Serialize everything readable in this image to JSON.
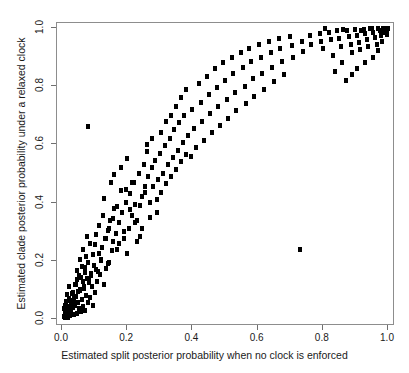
{
  "chart_data": {
    "type": "scatter",
    "title": "",
    "xlabel": "Estimated split posterior probability when no clock is enforced",
    "ylabel": "Estimated clade posterior probability under a relaxed clock",
    "xlim": [
      0.0,
      1.0
    ],
    "ylim": [
      0.0,
      1.0
    ],
    "xticks": [
      "0.0",
      "0.2",
      "0.4",
      "0.6",
      "0.8",
      "1.0"
    ],
    "xtick_values": [
      0.0,
      0.2,
      0.4,
      0.6,
      0.8,
      1.0
    ],
    "yticks": [
      "0.0",
      "0.2",
      "0.4",
      "0.6",
      "0.8",
      "1.0"
    ],
    "ytick_values": [
      0.0,
      0.2,
      0.4,
      0.6,
      0.8,
      1.0
    ],
    "grid": false,
    "legend": false,
    "marker": "filled-square",
    "marker_color": "#000000",
    "marker_size_px": 4,
    "border_color": "#8d8d8d",
    "background_color": "#ffffff",
    "n_points": 232,
    "series": [
      {
        "name": "clades",
        "points": [
          [
            0.005,
            0.01
          ],
          [
            0.008,
            0.004
          ],
          [
            0.01,
            0.022
          ],
          [
            0.012,
            0.008
          ],
          [
            0.006,
            0.035
          ],
          [
            0.015,
            0.015
          ],
          [
            0.018,
            0.006
          ],
          [
            0.009,
            0.048
          ],
          [
            0.021,
            0.03
          ],
          [
            0.013,
            0.06
          ],
          [
            0.024,
            0.012
          ],
          [
            0.017,
            0.042
          ],
          [
            0.028,
            0.024
          ],
          [
            0.011,
            0.018
          ],
          [
            0.031,
            0.055
          ],
          [
            0.02,
            0.07
          ],
          [
            0.034,
            0.038
          ],
          [
            0.014,
            0.085
          ],
          [
            0.037,
            0.016
          ],
          [
            0.026,
            0.062
          ],
          [
            0.04,
            0.045
          ],
          [
            0.019,
            0.028
          ],
          [
            0.043,
            0.078
          ],
          [
            0.029,
            0.034
          ],
          [
            0.046,
            0.02
          ],
          [
            0.033,
            0.092
          ],
          [
            0.049,
            0.058
          ],
          [
            0.023,
            0.11
          ],
          [
            0.052,
            0.036
          ],
          [
            0.038,
            0.072
          ],
          [
            0.055,
            0.1
          ],
          [
            0.027,
            0.05
          ],
          [
            0.058,
            0.026
          ],
          [
            0.042,
            0.12
          ],
          [
            0.061,
            0.066
          ],
          [
            0.032,
            0.088
          ],
          [
            0.064,
            0.044
          ],
          [
            0.047,
            0.135
          ],
          [
            0.067,
            0.105
          ],
          [
            0.036,
            0.064
          ],
          [
            0.07,
            0.03
          ],
          [
            0.051,
            0.15
          ],
          [
            0.073,
            0.082
          ],
          [
            0.041,
            0.118
          ],
          [
            0.076,
            0.14
          ],
          [
            0.056,
            0.098
          ],
          [
            0.079,
            0.056
          ],
          [
            0.045,
            0.165
          ],
          [
            0.082,
            0.125
          ],
          [
            0.06,
            0.18
          ],
          [
            0.085,
            0.074
          ],
          [
            0.05,
            0.095
          ],
          [
            0.088,
            0.155
          ],
          [
            0.065,
            0.13
          ],
          [
            0.091,
            0.11
          ],
          [
            0.054,
            0.205
          ],
          [
            0.094,
            0.048
          ],
          [
            0.07,
            0.16
          ],
          [
            0.097,
            0.185
          ],
          [
            0.059,
            0.142
          ],
          [
            0.1,
            0.09
          ],
          [
            0.075,
            0.215
          ],
          [
            0.104,
            0.17
          ],
          [
            0.063,
            0.24
          ],
          [
            0.108,
            0.128
          ],
          [
            0.08,
            0.195
          ],
          [
            0.112,
            0.225
          ],
          [
            0.068,
            0.112
          ],
          [
            0.116,
            0.152
          ],
          [
            0.085,
            0.26
          ],
          [
            0.12,
            0.2
          ],
          [
            0.072,
            0.178
          ],
          [
            0.124,
            0.245
          ],
          [
            0.09,
            0.148
          ],
          [
            0.128,
            0.118
          ],
          [
            0.077,
            0.285
          ],
          [
            0.132,
            0.275
          ],
          [
            0.095,
            0.222
          ],
          [
            0.136,
            0.172
          ],
          [
            0.082,
            0.132
          ],
          [
            0.08,
            0.66
          ],
          [
            0.14,
            0.305
          ],
          [
            0.1,
            0.255
          ],
          [
            0.144,
            0.195
          ],
          [
            0.148,
            0.34
          ],
          [
            0.105,
            0.29
          ],
          [
            0.152,
            0.235
          ],
          [
            0.11,
            0.162
          ],
          [
            0.156,
            0.265
          ],
          [
            0.115,
            0.32
          ],
          [
            0.16,
            0.38
          ],
          [
            0.12,
            0.205
          ],
          [
            0.165,
            0.295
          ],
          [
            0.125,
            0.355
          ],
          [
            0.17,
            0.24
          ],
          [
            0.13,
            0.415
          ],
          [
            0.175,
            0.33
          ],
          [
            0.135,
            0.275
          ],
          [
            0.18,
            0.44
          ],
          [
            0.14,
            0.19
          ],
          [
            0.185,
            0.365
          ],
          [
            0.145,
            0.31
          ],
          [
            0.19,
            0.275
          ],
          [
            0.15,
            0.47
          ],
          [
            0.195,
            0.4
          ],
          [
            0.155,
            0.345
          ],
          [
            0.2,
            0.225
          ],
          [
            0.16,
            0.495
          ],
          [
            0.205,
            0.31
          ],
          [
            0.17,
            0.385
          ],
          [
            0.21,
            0.43
          ],
          [
            0.175,
            0.26
          ],
          [
            0.215,
            0.355
          ],
          [
            0.18,
            0.52
          ],
          [
            0.22,
            0.47
          ],
          [
            0.19,
            0.3
          ],
          [
            0.225,
            0.395
          ],
          [
            0.195,
            0.445
          ],
          [
            0.23,
            0.34
          ],
          [
            0.2,
            0.55
          ],
          [
            0.235,
            0.5
          ],
          [
            0.21,
            0.375
          ],
          [
            0.24,
            0.285
          ],
          [
            0.215,
            0.47
          ],
          [
            0.245,
            0.42
          ],
          [
            0.225,
            0.33
          ],
          [
            0.25,
            0.53
          ],
          [
            0.23,
            0.265
          ],
          [
            0.255,
            0.455
          ],
          [
            0.24,
            0.39
          ],
          [
            0.26,
            0.575
          ],
          [
            0.245,
            0.31
          ],
          [
            0.265,
            0.49
          ],
          [
            0.255,
            0.435
          ],
          [
            0.27,
            0.35
          ],
          [
            0.26,
            0.6
          ],
          [
            0.275,
            0.52
          ],
          [
            0.27,
            0.4
          ],
          [
            0.28,
            0.455
          ],
          [
            0.275,
            0.62
          ],
          [
            0.29,
            0.365
          ],
          [
            0.285,
            0.545
          ],
          [
            0.295,
            0.48
          ],
          [
            0.29,
            0.41
          ],
          [
            0.305,
            0.64
          ],
          [
            0.3,
            0.57
          ],
          [
            0.31,
            0.5
          ],
          [
            0.305,
            0.435
          ],
          [
            0.32,
            0.68
          ],
          [
            0.315,
            0.595
          ],
          [
            0.325,
            0.53
          ],
          [
            0.32,
            0.465
          ],
          [
            0.335,
            0.7
          ],
          [
            0.33,
            0.62
          ],
          [
            0.34,
            0.555
          ],
          [
            0.335,
            0.49
          ],
          [
            0.35,
            0.73
          ],
          [
            0.345,
            0.65
          ],
          [
            0.355,
            0.58
          ],
          [
            0.35,
            0.515
          ],
          [
            0.365,
            0.76
          ],
          [
            0.36,
            0.675
          ],
          [
            0.37,
            0.605
          ],
          [
            0.365,
            0.54
          ],
          [
            0.38,
            0.79
          ],
          [
            0.375,
            0.7
          ],
          [
            0.385,
            0.63
          ],
          [
            0.38,
            0.565
          ],
          [
            0.395,
            0.56
          ],
          [
            0.4,
            0.72
          ],
          [
            0.405,
            0.655
          ],
          [
            0.41,
            0.59
          ],
          [
            0.42,
            0.81
          ],
          [
            0.425,
            0.745
          ],
          [
            0.43,
            0.68
          ],
          [
            0.435,
            0.615
          ],
          [
            0.445,
            0.835
          ],
          [
            0.45,
            0.77
          ],
          [
            0.455,
            0.705
          ],
          [
            0.46,
            0.64
          ],
          [
            0.47,
            0.86
          ],
          [
            0.475,
            0.795
          ],
          [
            0.48,
            0.73
          ],
          [
            0.485,
            0.665
          ],
          [
            0.495,
            0.88
          ],
          [
            0.5,
            0.82
          ],
          [
            0.505,
            0.755
          ],
          [
            0.51,
            0.69
          ],
          [
            0.52,
            0.9
          ],
          [
            0.525,
            0.845
          ],
          [
            0.53,
            0.78
          ],
          [
            0.535,
            0.715
          ],
          [
            0.55,
            0.915
          ],
          [
            0.555,
            0.865
          ],
          [
            0.56,
            0.8
          ],
          [
            0.565,
            0.74
          ],
          [
            0.575,
            0.93
          ],
          [
            0.58,
            0.885
          ],
          [
            0.585,
            0.825
          ],
          [
            0.59,
            0.765
          ],
          [
            0.605,
            0.945
          ],
          [
            0.61,
            0.9
          ],
          [
            0.615,
            0.845
          ],
          [
            0.62,
            0.79
          ],
          [
            0.635,
            0.955
          ],
          [
            0.64,
            0.915
          ],
          [
            0.645,
            0.865
          ],
          [
            0.65,
            0.815
          ],
          [
            0.665,
            0.965
          ],
          [
            0.67,
            0.93
          ],
          [
            0.675,
            0.885
          ],
          [
            0.68,
            0.84
          ],
          [
            0.7,
            0.97
          ],
          [
            0.705,
            0.94
          ],
          [
            0.71,
            0.9
          ],
          [
            0.73,
            0.24
          ],
          [
            0.735,
            0.955
          ],
          [
            0.74,
            0.92
          ],
          [
            0.76,
            0.975
          ],
          [
            0.765,
            0.945
          ],
          [
            0.79,
            0.98
          ],
          [
            0.795,
            0.955
          ],
          [
            0.8,
            0.93
          ],
          [
            0.82,
            0.985
          ],
          [
            0.825,
            0.96
          ],
          [
            0.83,
            0.905
          ],
          [
            0.845,
            0.99
          ],
          [
            0.85,
            0.965
          ],
          [
            0.855,
            0.935
          ],
          [
            0.86,
            0.88
          ],
          [
            0.875,
            0.992
          ],
          [
            0.88,
            0.97
          ],
          [
            0.885,
            0.945
          ],
          [
            0.89,
            0.915
          ],
          [
            0.9,
            0.995
          ],
          [
            0.905,
            0.975
          ],
          [
            0.91,
            0.95
          ],
          [
            0.915,
            0.925
          ],
          [
            0.925,
            0.996
          ],
          [
            0.93,
            0.98
          ],
          [
            0.935,
            0.96
          ],
          [
            0.94,
            0.935
          ],
          [
            0.95,
            0.997
          ],
          [
            0.955,
            0.985
          ],
          [
            0.96,
            0.968
          ],
          [
            0.965,
            0.945
          ],
          [
            0.97,
            0.998
          ],
          [
            0.975,
            0.99
          ],
          [
            0.98,
            0.975
          ],
          [
            0.985,
            0.999
          ],
          [
            0.988,
            0.985
          ],
          [
            0.992,
            0.995
          ],
          [
            0.995,
            1.0
          ],
          [
            0.998,
            0.992
          ],
          [
            1.0,
            0.998
          ],
          [
            0.996,
            0.978
          ],
          [
            0.945,
            0.998
          ],
          [
            0.918,
            0.99
          ],
          [
            0.862,
            0.995
          ],
          [
            0.808,
            0.998
          ],
          [
            0.838,
            0.85
          ],
          [
            0.872,
            0.82
          ],
          [
            0.905,
            0.86
          ],
          [
            0.955,
            0.9
          ],
          [
            0.928,
            0.88
          ],
          [
            0.89,
            0.84
          ],
          [
            0.968,
            0.922
          ],
          [
            0.982,
            0.955
          ]
        ]
      }
    ]
  }
}
